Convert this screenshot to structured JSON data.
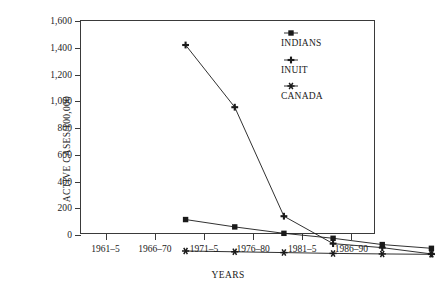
{
  "chart_data": {
    "type": "line",
    "title": "",
    "xlabel": "YEARS",
    "ylabel": "ACTIVE CASES/100,000",
    "categories": [
      "1961–5",
      "1966–70",
      "1971–5",
      "1976–80",
      "1981–5",
      "1986–90"
    ],
    "ylim": [
      0,
      1600
    ],
    "yticks": [
      0,
      200,
      400,
      600,
      800,
      1000,
      1200,
      1400,
      1600
    ],
    "ytick_labels": [
      "0",
      "200",
      "400",
      "600",
      "800",
      "1,000",
      "1,200",
      "1,400",
      "1,600"
    ],
    "grid": false,
    "legend_position": "inside-top-right",
    "series": [
      {
        "name": "INDIANS",
        "marker": "filled-square",
        "color": "#1a1a1a",
        "values": [
          265,
          210,
          162,
          125,
          78,
          50
        ]
      },
      {
        "name": "INUIT",
        "marker": "plus",
        "color": "#1a1a1a",
        "values": [
          1570,
          1105,
          290,
          85,
          55,
          8
        ]
      },
      {
        "name": "CANADA",
        "marker": "asterisk",
        "color": "#1a1a1a",
        "values": [
          30,
          24,
          18,
          12,
          8,
          5
        ]
      }
    ]
  },
  "legend": {
    "items": [
      {
        "label": "INDIANS",
        "marker": "filled-square"
      },
      {
        "label": "INUIT",
        "marker": "plus"
      },
      {
        "label": "CANADA",
        "marker": "asterisk"
      }
    ]
  }
}
